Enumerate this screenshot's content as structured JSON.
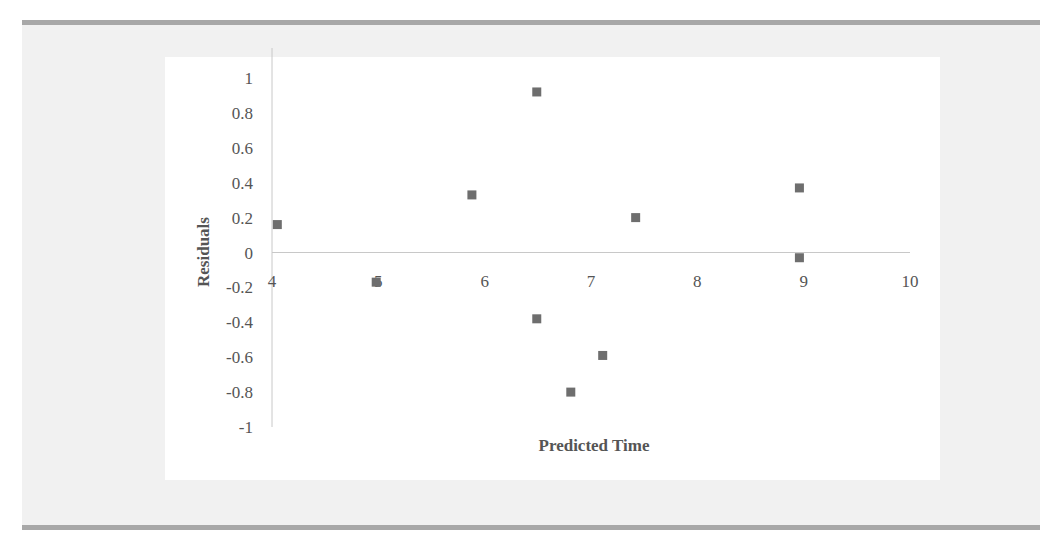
{
  "chart_data": {
    "type": "scatter",
    "title": "",
    "xlabel": "Predicted Time",
    "ylabel": "Residuals",
    "xlim": [
      4,
      10
    ],
    "ylim": [
      -1,
      1
    ],
    "x_ticks": [
      "4",
      "5",
      "6",
      "7",
      "8",
      "9",
      "10"
    ],
    "y_ticks": [
      "1",
      "0.8",
      "0.6",
      "0.4",
      "0.2",
      "0",
      "-0.2",
      "-0.4",
      "-0.6",
      "-0.8",
      "-1"
    ],
    "grid": false,
    "legend": null,
    "marker": "square",
    "marker_color": "#6e6e6e",
    "series": [
      {
        "name": "Residuals",
        "points": [
          {
            "x": 4.05,
            "y": 0.16
          },
          {
            "x": 4.98,
            "y": -0.17
          },
          {
            "x": 5.88,
            "y": 0.33
          },
          {
            "x": 6.49,
            "y": 0.92
          },
          {
            "x": 6.49,
            "y": -0.38
          },
          {
            "x": 6.81,
            "y": -0.8
          },
          {
            "x": 7.11,
            "y": -0.59
          },
          {
            "x": 7.42,
            "y": 0.2
          },
          {
            "x": 8.96,
            "y": 0.37
          },
          {
            "x": 8.96,
            "y": -0.03
          }
        ]
      }
    ]
  },
  "colors": {
    "panel_background": "#f1f1f1",
    "rule": "#a8a8a8",
    "axis": "#c8c8c8",
    "marker": "#6e6e6e",
    "text": "#555555"
  }
}
